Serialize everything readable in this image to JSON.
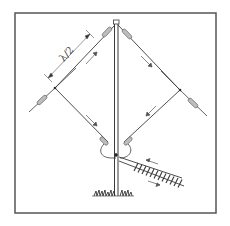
{
  "diagram": {
    "type": "antenna-schematic",
    "labels": {
      "dimension": "λ/2"
    },
    "colors": {
      "line": "#3a3a3a",
      "frame": "#555555",
      "background": "#ffffff",
      "insulator": "#9a9a9a"
    },
    "elements": [
      {
        "name": "mast",
        "kind": "vertical pole"
      },
      {
        "name": "upper-left-wire",
        "kind": "wire"
      },
      {
        "name": "upper-right-wire",
        "kind": "wire"
      },
      {
        "name": "lower-left-wire",
        "kind": "wire"
      },
      {
        "name": "lower-right-wire",
        "kind": "wire"
      },
      {
        "name": "insulators",
        "count": 4
      },
      {
        "name": "current-arrows",
        "count": 6
      },
      {
        "name": "ladder-feed-line",
        "kind": "twin-lead"
      },
      {
        "name": "ground-grass"
      }
    ]
  }
}
